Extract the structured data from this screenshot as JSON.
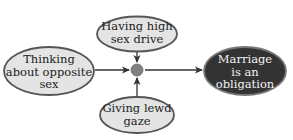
{
  "diagram": {
    "nodes": {
      "top": {
        "lines": [
          "Having high",
          "sex drive"
        ]
      },
      "left": {
        "lines": [
          "Thinking",
          "about opposite",
          "sex"
        ]
      },
      "bottom": {
        "lines": [
          "Giving lewd",
          "gaze"
        ]
      },
      "right": {
        "lines": [
          "Marriage",
          "is an",
          "obligation"
        ]
      }
    },
    "edges": [
      {
        "from": "top",
        "to": "center"
      },
      {
        "from": "left",
        "to": "center"
      },
      {
        "from": "bottom",
        "to": "center"
      },
      {
        "from": "center",
        "to": "right"
      }
    ],
    "colors": {
      "light_fill": "#e4e4e4",
      "light_stroke": "#555555",
      "dark_fill": "#333333",
      "dark_stroke": "#777777",
      "junction_fill": "#808080",
      "arrow": "#333333"
    }
  }
}
